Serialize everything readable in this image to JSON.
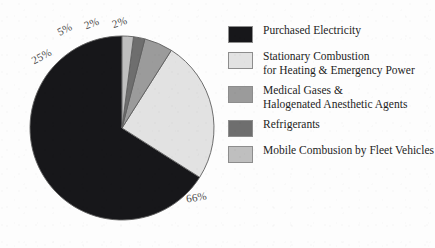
{
  "chart_data": {
    "type": "pie",
    "title": "",
    "subtitle": "",
    "xlabel": "",
    "ylabel": "",
    "grid": false,
    "legend_position": "right",
    "start_angle_deg": 90,
    "direction": "counterclockwise",
    "categories": [
      "Purchased Electricity",
      "Stationary Combustion for Heating & Emergency Power",
      "Medical Gases & Halogenated Anesthetic Agents",
      "Refrigerants",
      "Mobile Combusion by Fleet Vehicles"
    ],
    "values": [
      66,
      25,
      5,
      2,
      2
    ],
    "value_labels": [
      "66%",
      "25%",
      "5%",
      "2%",
      "2%"
    ],
    "colors": [
      "#17171a",
      "#e2e2e2",
      "#9b9b9b",
      "#6e6e6e",
      "#bfbfbf"
    ],
    "slices": [
      {
        "label": "Purchased Electricity",
        "value": 66,
        "value_label": "66%",
        "color": "#17171a"
      },
      {
        "label": "Stationary Combustion for Heating & Emergency Power",
        "value": 25,
        "value_label": "25%",
        "color": "#e2e2e2"
      },
      {
        "label": "Medical Gases & Halogenated Anesthetic Agents",
        "value": 5,
        "value_label": "5%",
        "color": "#9b9b9b"
      },
      {
        "label": "Refrigerants",
        "value": 2,
        "value_label": "2%",
        "color": "#6e6e6e"
      },
      {
        "label": "Mobile Combusion by Fleet Vehicles",
        "value": 2,
        "value_label": "2%",
        "color": "#bfbfbf"
      }
    ]
  },
  "pie": {
    "labels": {
      "purchased_electricity": "66%",
      "stationary_combustion": "25%",
      "medical_gases": "5%",
      "refrigerants": "2%",
      "mobile_combustion": "2%"
    }
  },
  "legend": {
    "items": [
      {
        "swatch_color": "#17171a",
        "line1": "Purchased Electricity",
        "line2": ""
      },
      {
        "swatch_color": "#e2e2e2",
        "line1": "Stationary Combustion",
        "line2": "for Heating & Emergency Power"
      },
      {
        "swatch_color": "#9b9b9b",
        "line1": "Medical Gases &",
        "line2": "Halogenated Anesthetic Agents"
      },
      {
        "swatch_color": "#6e6e6e",
        "line1": "Refrigerants",
        "line2": ""
      },
      {
        "swatch_color": "#bfbfbf",
        "line1": "Mobile Combusion by Fleet Vehicles",
        "line2": ""
      }
    ]
  }
}
